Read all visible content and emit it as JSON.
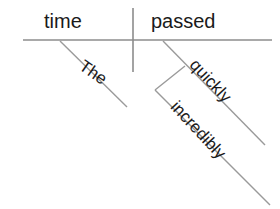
{
  "diagram": {
    "type": "reed-kellogg-sentence-diagram",
    "sentence": "The time passed incredibly quickly",
    "colors": {
      "line": "#8c8c8c",
      "text": "#1a1a1a",
      "background": "#ffffff"
    },
    "words": {
      "subject": "time",
      "verb": "passed",
      "article": "The",
      "adverb": "quickly",
      "adverb_modifier": "incredibly"
    },
    "lines": {
      "baseline": {
        "x1": 23,
        "y1": 40,
        "x2": 272,
        "y2": 40
      },
      "subject_verb_divider": {
        "x1": 133,
        "y1": 8,
        "x2": 133,
        "y2": 72
      },
      "article_diagonal": {
        "x1": 60,
        "y1": 41,
        "x2": 127,
        "y2": 107
      },
      "adverb_diagonal": {
        "x1": 163,
        "y1": 41,
        "x2": 265,
        "y2": 145
      },
      "adverb_connector": {
        "x1": 185,
        "y1": 66,
        "x2": 155,
        "y2": 90
      },
      "adverb_modifier_diagonal": {
        "x1": 155,
        "y1": 90,
        "x2": 270,
        "y2": 205
      }
    }
  }
}
